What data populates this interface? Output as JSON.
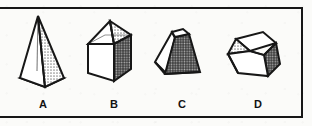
{
  "figure": {
    "kind": "multiple-choice-geometry-figure",
    "background_color": "#fbfbf9",
    "ink_color": "#171717",
    "frame": {
      "name": "answer-options-frame",
      "border_color": "#171717",
      "border_width_px": 2,
      "left_edge_cropped": true
    },
    "options": [
      {
        "label": "A",
        "shape_name": "tall-square-pyramid",
        "faces": {
          "left": "white",
          "right": "light-dotted",
          "base": "dark-dotted"
        },
        "shading_colors": {
          "light": "#cfcfcf",
          "dark": "#4a4a4a"
        }
      },
      {
        "label": "B",
        "shape_name": "cube-with-pyramid-roof",
        "faces": {
          "front": "white",
          "right": "dark-dotted",
          "roof_left": "white",
          "roof_right": "light-dotted"
        },
        "shading_colors": {
          "light": "#cbcbcb",
          "dark": "#4a4a4a"
        }
      },
      {
        "label": "C",
        "shape_name": "truncated-pyramid-frustum",
        "faces": {
          "front": "dark-dotted",
          "left": "white",
          "top": "white"
        },
        "shading_colors": {
          "light": "#d2d2d2",
          "dark": "#4a4a4a"
        }
      },
      {
        "label": "D",
        "shape_name": "open-top-cube-box",
        "faces": {
          "front": "white",
          "interior_left": "light-dotted",
          "interior_back": "white",
          "right": "dark-dotted"
        },
        "shading_colors": {
          "light": "#cfcfcf",
          "dark": "#4a4a4a"
        }
      }
    ]
  }
}
